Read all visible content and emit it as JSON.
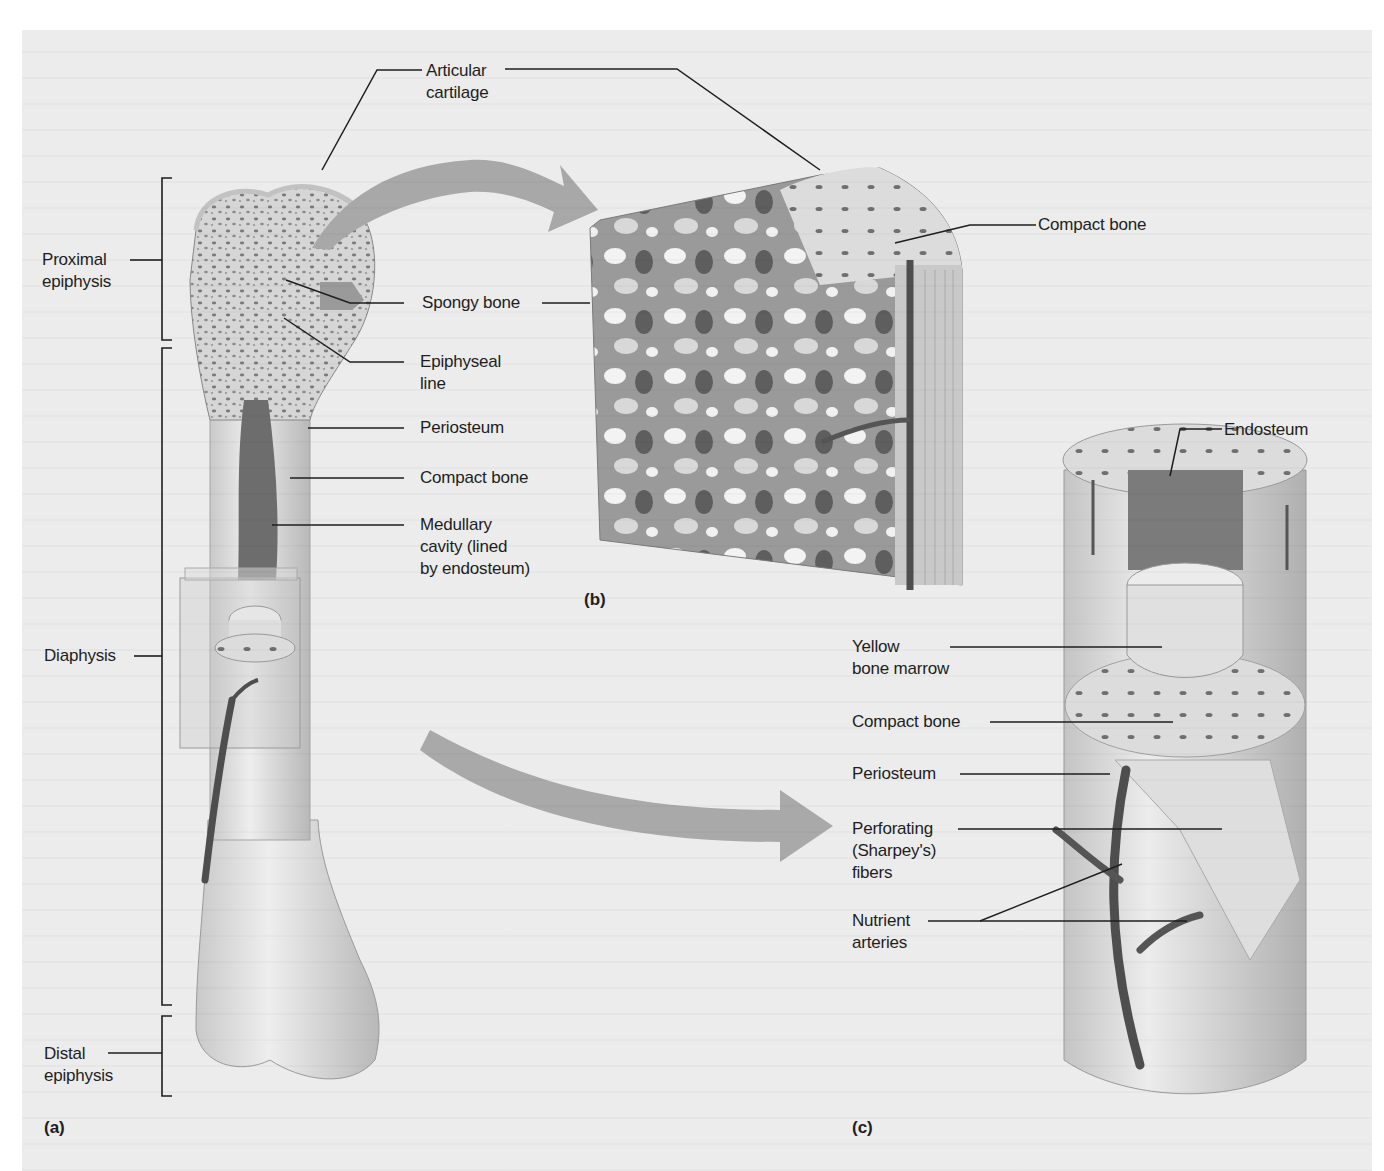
{
  "figure": {
    "panels": [
      {
        "id": "a",
        "label": "(a)"
      },
      {
        "id": "b",
        "label": "(b)"
      },
      {
        "id": "c",
        "label": "(c)"
      }
    ],
    "panel_a": {
      "regions": {
        "proximal_epiphysis": [
          "Proximal",
          "epiphysis"
        ],
        "diaphysis": [
          "Diaphysis"
        ],
        "distal_epiphysis": [
          "Distal",
          "epiphysis"
        ]
      },
      "labels": {
        "articular_cartilage": [
          "Articular",
          "cartilage"
        ],
        "spongy_bone": "Spongy bone",
        "epiphyseal_line": [
          "Epiphyseal",
          "line"
        ],
        "periosteum": "Periosteum",
        "compact_bone": "Compact bone",
        "medullary_cavity": [
          "Medullary",
          "cavity (lined",
          "by endosteum)"
        ]
      }
    },
    "panel_b": {
      "labels": {
        "compact_bone": "Compact bone"
      }
    },
    "panel_c": {
      "labels": {
        "endosteum": "Endosteum",
        "yellow_bone_marrow": [
          "Yellow",
          "bone marrow"
        ],
        "compact_bone": "Compact bone",
        "periosteum": "Periosteum",
        "perforating_fibers": [
          "Perforating",
          "(Sharpey's)",
          "fibers"
        ],
        "nutrient_arteries": [
          "Nutrient",
          "arteries"
        ]
      }
    },
    "colors": {
      "background": "#ececec",
      "bone_light": "#e4e4e4",
      "bone_mid": "#c8c8c8",
      "bone_dark": "#8a8a8a",
      "marrow_dark": "#6a6a6a",
      "artery": "#5a5a5a",
      "arrow": "#a8a8a8",
      "leader_line": "#1e1e1e"
    }
  }
}
